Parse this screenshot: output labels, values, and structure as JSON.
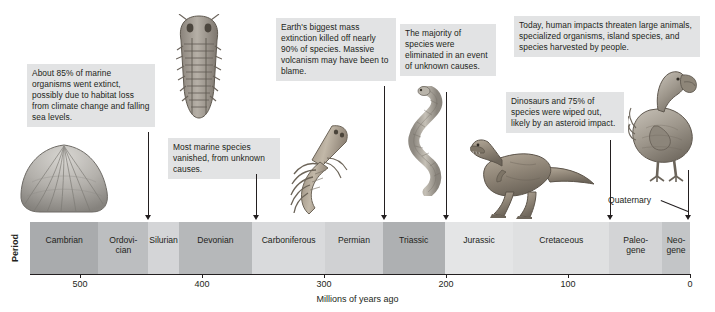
{
  "figure": {
    "row_label": "Period",
    "axis_title": "Millions of years ago",
    "quaternary_label": "Quaternary"
  },
  "chart_data": {
    "type": "table",
    "xlabel": "Millions of years ago",
    "ylabel": "Period",
    "xlim": [
      541,
      0
    ],
    "x_ticks": [
      "500",
      "400",
      "300",
      "200",
      "100",
      "0"
    ],
    "x_tick_values": [
      500,
      400,
      300,
      200,
      100,
      0
    ],
    "grid": false,
    "legend": "none",
    "axis_direction": "reversed (oldest at left)",
    "categories": [
      "Cambrian",
      "Ordovician",
      "Silurian",
      "Devonian",
      "Carboniferous",
      "Permian",
      "Triassic",
      "Jurassic",
      "Cretaceous",
      "Paleogene",
      "Neogene"
    ],
    "periods": [
      {
        "name": "Cambrian",
        "label": "Cambrian",
        "start": 541,
        "end": 485,
        "color": "#a9abad"
      },
      {
        "name": "Ordovician",
        "label": "Ordovi-\ncian",
        "start": 485,
        "end": 444,
        "color": "#bcbec0"
      },
      {
        "name": "Silurian",
        "label": "Silurian",
        "start": 444,
        "end": 419,
        "color": "#d4d5d7"
      },
      {
        "name": "Devonian",
        "label": "Devonian",
        "start": 419,
        "end": 359,
        "color": "#b6b8ba"
      },
      {
        "name": "Carboniferous",
        "label": "Carboniferous",
        "start": 359,
        "end": 299,
        "color": "#d9dadc"
      },
      {
        "name": "Permian",
        "label": "Permian",
        "start": 299,
        "end": 252,
        "color": "#d0d1d3"
      },
      {
        "name": "Triassic",
        "label": "Triassic",
        "start": 252,
        "end": 201,
        "color": "#aeb0b2"
      },
      {
        "name": "Jurassic",
        "label": "Jurassic",
        "start": 201,
        "end": 145,
        "color": "#e4e5e6"
      },
      {
        "name": "Cretaceous",
        "label": "Cretaceous",
        "start": 145,
        "end": 66,
        "color": "#dfe0e1"
      },
      {
        "name": "Paleogene",
        "label": "Paleo-\ngene",
        "start": 66,
        "end": 23,
        "color": "#d3d4d6"
      },
      {
        "name": "Neogene",
        "label": "Neo-\ngene",
        "start": 23,
        "end": 0,
        "color": "#c3c5c7"
      }
    ],
    "extinction_events": [
      {
        "id": "ordovician",
        "age_mya": 444,
        "text": "About 85% of marine organisms went extinct, possibly due to habitat loss from climate change and falling sea levels."
      },
      {
        "id": "devonian",
        "age_mya": 359,
        "text": "Most marine species vanished, from unknown causes."
      },
      {
        "id": "permian",
        "age_mya": 252,
        "text": "Earth's biggest mass extinction killed off nearly 90% of species. Massive volcanism may have been to blame."
      },
      {
        "id": "triassic",
        "age_mya": 201,
        "text": "The majority of species were eliminated in an event of unknown causes."
      },
      {
        "id": "cretaceous",
        "age_mya": 66,
        "text": "Dinosaurs and 75% of species were wiped out, likely by an asteroid impact."
      },
      {
        "id": "modern",
        "age_mya": 0,
        "text": "Today, human impacts threaten large animals, specialized organisms, island species, and species harvested by people."
      }
    ]
  },
  "callouts": [
    {
      "id": "ordovician",
      "text": "About 85% of marine organisms went extinct, possibly due to habitat loss from climate change and falling sea levels."
    },
    {
      "id": "devonian",
      "text": "Most marine species vanished, from unknown causes."
    },
    {
      "id": "permian",
      "text": "Earth's biggest mass extinction killed off nearly 90% of species. Massive volcanism may have been to blame."
    },
    {
      "id": "triassic",
      "text": "The majority of species were eliminated in an event of unknown causes."
    },
    {
      "id": "cretaceous",
      "text": "Dinosaurs and 75% of species were wiped out, likely by an asteroid impact."
    },
    {
      "id": "modern",
      "text": "Today, human impacts threaten large animals, specialized organisms, island species, and species harvested by people."
    }
  ],
  "organisms": [
    {
      "id": "brachiopod",
      "name": "brachiopod-shell-illustration"
    },
    {
      "id": "trilobite",
      "name": "trilobite-illustration"
    },
    {
      "id": "eurypterid",
      "name": "sea-scorpion-illustration"
    },
    {
      "id": "snake",
      "name": "snake-illustration"
    },
    {
      "id": "trex",
      "name": "tyrannosaurus-illustration"
    },
    {
      "id": "dodo",
      "name": "dodo-bird-illustration"
    }
  ],
  "colors": {
    "callout_bg": "#e2e3e4",
    "text": "#231f20",
    "line": "#231f20",
    "background": "#ffffff"
  }
}
